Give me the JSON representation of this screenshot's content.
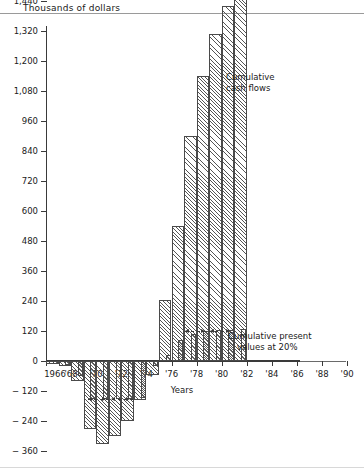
{
  "chart_data": {
    "type": "bar",
    "title": "",
    "ylabel": "Thousands of dollars",
    "xlabel": "Years",
    "ylim": [
      -360,
      1560
    ],
    "xlim": [
      1966,
      1990
    ],
    "grid": false,
    "ytick_labels": [
      "1,560",
      "1,440",
      "1,320",
      "1,200",
      "1,080",
      "960",
      "840",
      "720",
      "600",
      "480",
      "360",
      "240",
      "120",
      "0",
      "− 120",
      "− 240",
      "− 360"
    ],
    "ytick_values": [
      1560,
      1440,
      1320,
      1200,
      1080,
      960,
      840,
      720,
      600,
      480,
      360,
      240,
      120,
      0,
      -120,
      -240,
      -360
    ],
    "xtick_labels": [
      "1966",
      "'68",
      "'70",
      "'72",
      "'74",
      "'76",
      "'78",
      "'80",
      "'82",
      "'84",
      "'86",
      "'88",
      "'90"
    ],
    "xtick_values": [
      1966,
      1968,
      1970,
      1972,
      1974,
      1976,
      1978,
      1980,
      1982,
      1984,
      1986,
      1988,
      1990
    ],
    "categories": [
      1966,
      1967,
      1968,
      1969,
      1970,
      1971,
      1972,
      1973,
      1974,
      1975,
      1976,
      1977,
      1978,
      1979,
      1980,
      1981
    ],
    "series": [
      {
        "name": "Cumulative cash flows",
        "key": "cash",
        "values": [
          -12,
          -20,
          -80,
          -272,
          -332,
          -300,
          -240,
          -155,
          -56,
          244,
          540,
          900,
          1140,
          1310,
          1420,
          1460
        ]
      },
      {
        "name": "Cumulative present values at 20%",
        "key": "pv",
        "values": [
          -10,
          -16,
          -60,
          -152,
          -152,
          -152,
          -152,
          -148,
          -20,
          24,
          84,
          110,
          120,
          124,
          126,
          128
        ]
      }
    ],
    "annotations": [
      {
        "name": "cumulative-cash-flows",
        "line1": "Cumulative",
        "line2": "cash flows"
      },
      {
        "name": "cumulative-present-values",
        "line1": "Cumulative present",
        "line2": "values at 20%"
      }
    ],
    "colors": {
      "hatch": "#555555",
      "outline": "#4a4a4a",
      "axis": "#3a3a3a",
      "text": "#1a1a1a"
    }
  },
  "annotation_cash": {
    "line1": "Cumulative",
    "line2": "cash flows"
  },
  "annotation_pv": {
    "line1": "Cumulative present",
    "line2": "values at 20%"
  },
  "axis": {
    "y_title": "Thousands of dollars",
    "x_title": "Years"
  }
}
